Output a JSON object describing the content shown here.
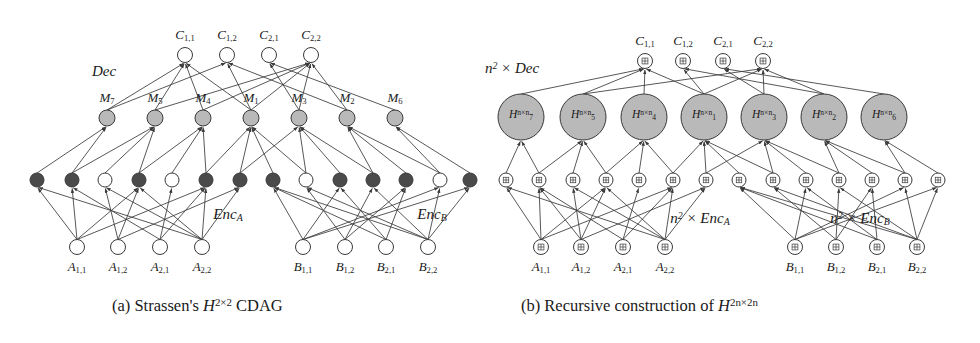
{
  "figure": {
    "width": 980,
    "height": 343,
    "background": "#ffffff",
    "stroke": "#3a3a3a",
    "node_fill_light": "#ffffff",
    "node_fill_dark": "#4a4a4a",
    "node_fill_gray": "#b9b9b9",
    "panels": [
      {
        "id": "panel-a",
        "caption_prefix": "(a)",
        "caption_text": "Strassen's",
        "caption_symbol": "H",
        "caption_symbol_sup": "2×2",
        "caption_suffix": "CDAG",
        "caption_full": "(a) Strassen's H^{2×2} CDAG",
        "group_labels": [
          {
            "name": "dec",
            "text": "Dec",
            "x": 104,
            "y": 63
          },
          {
            "name": "enc-a",
            "text": "Enc",
            "sub": "A",
            "x": 228,
            "y": 206
          },
          {
            "name": "enc-b",
            "text": "Enc",
            "sub": "B",
            "x": 432,
            "y": 206
          }
        ],
        "output_row": {
          "name": "C",
          "y": 55,
          "radius": 7.5,
          "fill": "#ffffff",
          "nodes": [
            {
              "label_base": "C",
              "label_sub": "1,1",
              "x": 185
            },
            {
              "label_base": "C",
              "label_sub": "1,2",
              "x": 227
            },
            {
              "label_base": "C",
              "label_sub": "2,1",
              "x": 269
            },
            {
              "label_base": "C",
              "label_sub": "2,2",
              "x": 311
            }
          ]
        },
        "middle_row": {
          "name": "M",
          "y": 118,
          "radius": 8,
          "fill": "#b9b9b9",
          "nodes": [
            {
              "label_base": "M",
              "label_sub": "7",
              "x": 107
            },
            {
              "label_base": "M",
              "label_sub": "5",
              "x": 155
            },
            {
              "label_base": "M",
              "label_sub": "4",
              "x": 203
            },
            {
              "label_base": "M",
              "label_sub": "1",
              "x": 251
            },
            {
              "label_base": "M",
              "label_sub": "3",
              "x": 299
            },
            {
              "label_base": "M",
              "label_sub": "2",
              "x": 347
            },
            {
              "label_base": "M",
              "label_sub": "6",
              "x": 395
            }
          ]
        },
        "encoder_row": {
          "y": 180,
          "radius": 7,
          "nodes": [
            {
              "x": 37,
              "dark": true
            },
            {
              "x": 72,
              "dark": true
            },
            {
              "x": 105,
              "dark": false
            },
            {
              "x": 139,
              "dark": true
            },
            {
              "x": 172,
              "dark": false
            },
            {
              "x": 206,
              "dark": true
            },
            {
              "x": 240,
              "dark": true
            },
            {
              "x": 273,
              "dark": true
            },
            {
              "x": 306,
              "dark": false
            },
            {
              "x": 340,
              "dark": true
            },
            {
              "x": 373,
              "dark": true
            },
            {
              "x": 406,
              "dark": true
            },
            {
              "x": 440,
              "dark": false
            },
            {
              "x": 470,
              "dark": true
            }
          ]
        },
        "input_row": {
          "y": 247,
          "radius": 7.5,
          "fill": "#ffffff",
          "nodes": [
            {
              "label_base": "A",
              "label_sub": "1,1",
              "x": 77
            },
            {
              "label_base": "A",
              "label_sub": "1,2",
              "x": 118
            },
            {
              "label_base": "A",
              "label_sub": "2,1",
              "x": 160
            },
            {
              "label_base": "A",
              "label_sub": "2,2",
              "x": 202
            },
            {
              "label_base": "B",
              "label_sub": "1,1",
              "x": 303
            },
            {
              "label_base": "B",
              "label_sub": "1,2",
              "x": 345
            },
            {
              "label_base": "B",
              "label_sub": "2,1",
              "x": 386
            },
            {
              "label_base": "B",
              "label_sub": "2,2",
              "x": 428
            }
          ]
        },
        "edges_input_to_enc": [
          [
            0,
            0
          ],
          [
            0,
            1
          ],
          [
            0,
            3
          ],
          [
            0,
            5
          ],
          [
            1,
            2
          ],
          [
            1,
            3
          ],
          [
            1,
            6
          ],
          [
            2,
            1
          ],
          [
            2,
            4
          ],
          [
            2,
            5
          ],
          [
            3,
            0
          ],
          [
            3,
            2
          ],
          [
            3,
            3
          ],
          [
            3,
            5
          ],
          [
            3,
            6
          ],
          [
            4,
            7
          ],
          [
            4,
            9
          ],
          [
            4,
            12
          ],
          [
            4,
            13
          ],
          [
            5,
            8
          ],
          [
            5,
            10
          ],
          [
            5,
            11
          ],
          [
            6,
            7
          ],
          [
            6,
            9
          ],
          [
            6,
            11
          ],
          [
            7,
            7
          ],
          [
            7,
            8
          ],
          [
            7,
            10
          ],
          [
            7,
            12
          ],
          [
            7,
            13
          ]
        ],
        "edges_enc_to_mid": [
          [
            0,
            0
          ],
          [
            1,
            0
          ],
          [
            2,
            1
          ],
          [
            3,
            1
          ],
          [
            4,
            2
          ],
          [
            5,
            2
          ],
          [
            6,
            3
          ],
          [
            7,
            3
          ],
          [
            8,
            4
          ],
          [
            9,
            4
          ],
          [
            10,
            5
          ],
          [
            11,
            5
          ],
          [
            12,
            6
          ],
          [
            13,
            6
          ],
          [
            1,
            1
          ],
          [
            3,
            2
          ],
          [
            5,
            3
          ],
          [
            6,
            4
          ],
          [
            8,
            3
          ],
          [
            10,
            4
          ],
          [
            12,
            5
          ]
        ],
        "edges_mid_to_out": [
          [
            0,
            0
          ],
          [
            1,
            0
          ],
          [
            2,
            0
          ],
          [
            3,
            0
          ],
          [
            3,
            1
          ],
          [
            5,
            1
          ],
          [
            4,
            2
          ],
          [
            6,
            2
          ],
          [
            1,
            3
          ],
          [
            3,
            3
          ],
          [
            4,
            3
          ],
          [
            5,
            3
          ],
          [
            2,
            3
          ],
          [
            0,
            1
          ]
        ]
      },
      {
        "id": "panel-b",
        "caption_prefix": "(b)",
        "caption_text": "Recursive construction of",
        "caption_symbol": "H",
        "caption_symbol_sup": "2n×2n",
        "caption_full": "(b) Recursive construction of H^{2n×2n}",
        "group_labels": [
          {
            "name": "n2-dec",
            "text": "n",
            "sup": "2",
            "mul": " × ",
            "italic_tail": "Dec",
            "x": 512,
            "y": 60
          },
          {
            "name": "n2-enc-a",
            "text": "n",
            "sup": "2",
            "mul": " × ",
            "italic_tail": "Enc",
            "sub_tail": "A",
            "x": 700,
            "y": 210
          },
          {
            "name": "n2-enc-b",
            "text": "n",
            "sup": "2",
            "mul": " × ",
            "italic_tail": "Enc",
            "sub_tail": "B",
            "x": 860,
            "y": 210
          }
        ],
        "output_row": {
          "name": "C",
          "y": 61,
          "radius": 7.5,
          "fill": "#ffffff",
          "glyph": "grid-icon",
          "nodes": [
            {
              "label_base": "C",
              "label_sub": "1,1",
              "x": 645
            },
            {
              "label_base": "C",
              "label_sub": "1,2",
              "x": 683
            },
            {
              "label_base": "C",
              "label_sub": "2,1",
              "x": 723
            },
            {
              "label_base": "C",
              "label_sub": "2,2",
              "x": 763
            }
          ]
        },
        "middle_row": {
          "name": "H",
          "y": 117,
          "radius": 23,
          "fill": "#b9b9b9",
          "nodes": [
            {
              "label_base": "H",
              "label_sub": "7",
              "label_sup": "n×n",
              "x": 521
            },
            {
              "label_base": "H",
              "label_sub": "5",
              "label_sup": "n×n",
              "x": 583
            },
            {
              "label_base": "H",
              "label_sub": "4",
              "label_sup": "n×n",
              "x": 644
            },
            {
              "label_base": "H",
              "label_sub": "1",
              "label_sup": "n×n",
              "x": 704
            },
            {
              "label_base": "H",
              "label_sub": "3",
              "label_sup": "n×n",
              "x": 764
            },
            {
              "label_base": "H",
              "label_sub": "2",
              "label_sup": "n×n",
              "x": 824
            },
            {
              "label_base": "H",
              "label_sub": "6",
              "label_sup": "n×n",
              "x": 884
            }
          ]
        },
        "encoder_row": {
          "y": 180,
          "radius": 7,
          "fill": "#ffffff",
          "glyph": "grid-icon",
          "nodes": [
            {
              "x": 506
            },
            {
              "x": 539
            },
            {
              "x": 573
            },
            {
              "x": 606
            },
            {
              "x": 639
            },
            {
              "x": 673
            },
            {
              "x": 706
            },
            {
              "x": 739
            },
            {
              "x": 773
            },
            {
              "x": 806
            },
            {
              "x": 839
            },
            {
              "x": 872
            },
            {
              "x": 905
            },
            {
              "x": 938
            }
          ]
        },
        "input_row": {
          "y": 247,
          "radius": 7.5,
          "fill": "#ffffff",
          "glyph": "grid-icon",
          "nodes": [
            {
              "label_base": "A",
              "label_sub": "1,1",
              "x": 541
            },
            {
              "label_base": "A",
              "label_sub": "1,2",
              "x": 581
            },
            {
              "label_base": "A",
              "label_sub": "2,1",
              "x": 623
            },
            {
              "label_base": "A",
              "label_sub": "2,2",
              "x": 665
            },
            {
              "label_base": "B",
              "label_sub": "1,1",
              "x": 795
            },
            {
              "label_base": "B",
              "label_sub": "1,2",
              "x": 836
            },
            {
              "label_base": "B",
              "label_sub": "2,1",
              "x": 877
            },
            {
              "label_base": "B",
              "label_sub": "2,2",
              "x": 917
            }
          ]
        },
        "edges_input_to_enc": [
          [
            0,
            0
          ],
          [
            0,
            1
          ],
          [
            0,
            3
          ],
          [
            0,
            5
          ],
          [
            1,
            1
          ],
          [
            1,
            2
          ],
          [
            1,
            3
          ],
          [
            1,
            6
          ],
          [
            2,
            1
          ],
          [
            2,
            4
          ],
          [
            2,
            5
          ],
          [
            3,
            0
          ],
          [
            3,
            2
          ],
          [
            3,
            3
          ],
          [
            3,
            5
          ],
          [
            3,
            6
          ],
          [
            4,
            7
          ],
          [
            4,
            9
          ],
          [
            4,
            12
          ],
          [
            4,
            13
          ],
          [
            5,
            8
          ],
          [
            5,
            10
          ],
          [
            5,
            11
          ],
          [
            6,
            7
          ],
          [
            6,
            9
          ],
          [
            6,
            11
          ],
          [
            7,
            7
          ],
          [
            7,
            8
          ],
          [
            7,
            10
          ],
          [
            7,
            12
          ],
          [
            7,
            13
          ]
        ],
        "edges_enc_to_mid": [
          [
            0,
            0
          ],
          [
            1,
            0
          ],
          [
            2,
            1
          ],
          [
            3,
            1
          ],
          [
            4,
            2
          ],
          [
            5,
            2
          ],
          [
            6,
            3
          ],
          [
            7,
            3
          ],
          [
            8,
            4
          ],
          [
            9,
            4
          ],
          [
            10,
            5
          ],
          [
            11,
            5
          ],
          [
            12,
            6
          ],
          [
            13,
            6
          ],
          [
            1,
            1
          ],
          [
            3,
            2
          ],
          [
            5,
            3
          ],
          [
            6,
            4
          ],
          [
            8,
            3
          ],
          [
            10,
            4
          ],
          [
            12,
            5
          ]
        ],
        "edges_mid_to_out": [
          [
            0,
            0
          ],
          [
            1,
            0
          ],
          [
            2,
            0
          ],
          [
            3,
            0
          ],
          [
            3,
            1
          ],
          [
            5,
            1
          ],
          [
            4,
            2
          ],
          [
            6,
            2
          ],
          [
            1,
            3
          ],
          [
            3,
            3
          ],
          [
            4,
            3
          ],
          [
            5,
            3
          ]
        ]
      }
    ],
    "captions": [
      {
        "name": "caption-a",
        "x": 112,
        "y": 300
      },
      {
        "name": "caption-b",
        "x": 521,
        "y": 300
      }
    ]
  }
}
